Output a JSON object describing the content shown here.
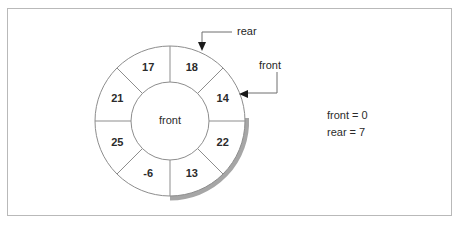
{
  "figure": {
    "type": "circular-queue-diagram",
    "center_label": "front",
    "segments": [
      {
        "index": 0,
        "value": "18",
        "position": "top-right-of-top",
        "angle_deg": 337.5
      },
      {
        "index": 1,
        "value": "14",
        "position": "upper-right",
        "angle_deg": 22.5
      },
      {
        "index": 2,
        "value": "22",
        "position": "lower-right",
        "angle_deg": 67.5
      },
      {
        "index": 3,
        "value": "13",
        "position": "bottom-right",
        "angle_deg": 112.5
      },
      {
        "index": 4,
        "value": "-6",
        "position": "bottom-left",
        "angle_deg": 157.5
      },
      {
        "index": 5,
        "value": "25",
        "position": "lower-left",
        "angle_deg": 202.5
      },
      {
        "index": 6,
        "value": "21",
        "position": "upper-left",
        "angle_deg": 247.5
      },
      {
        "index": 7,
        "value": "17",
        "position": "top-left-of-top",
        "angle_deg": 292.5
      }
    ],
    "annotations": [
      {
        "id": "rear",
        "label": "rear",
        "points_to": "top-of-ring"
      },
      {
        "id": "front",
        "label": "front",
        "points_to": "upper-right-of-ring"
      }
    ],
    "legend": {
      "front_line": "front = 0",
      "rear_line": "rear = 7"
    },
    "colors": {
      "ring_stroke": "#8d8d8d",
      "shadow": "#a6a6a6",
      "text": "#2b2b2b",
      "frame_border": "#b9b9b9",
      "background": "#ffffff"
    }
  }
}
